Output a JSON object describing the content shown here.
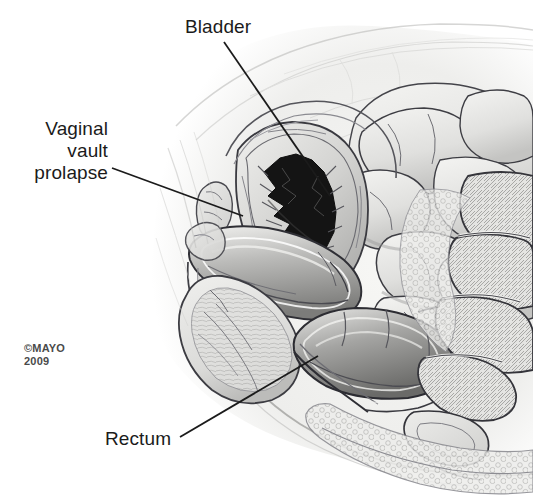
{
  "figure": {
    "background_color": "#ffffff",
    "width": 533,
    "height": 499
  },
  "labels": {
    "bladder": "Bladder",
    "vaginal_vault_prolapse": "Vaginal\nvault\nprolapse",
    "rectum": "Rectum"
  },
  "credit": {
    "text": "©MAYO\n2009"
  },
  "colors": {
    "label_text": "#1b1b1b",
    "credit_text": "#4a4a4a",
    "leader_line": "#1b1b1b",
    "ink_outline": "#2e2e2e",
    "lumen_dark": "#141414",
    "tissue_light": "#e8e8e6",
    "tissue_mid": "#c9c9c7",
    "tissue_shadow": "#9a9a98",
    "bowel_fill": "#e2e2e0"
  },
  "leader_lines": [
    {
      "name": "bladder-leader",
      "x1": 224,
      "y1": 42,
      "x2": 330,
      "y2": 196
    },
    {
      "name": "vaginal-vault-leader",
      "x1": 112,
      "y1": 168,
      "x2": 243,
      "y2": 216
    },
    {
      "name": "rectum-leader",
      "x1": 180,
      "y1": 437,
      "x2": 318,
      "y2": 356
    }
  ],
  "anatomy_parts": [
    "abdominal-wall",
    "small-bowel-loops",
    "bladder",
    "bladder-lumen",
    "prolapsed-vaginal-vault",
    "rectum",
    "anal-canal",
    "sacrum",
    "coccyx",
    "perineal-body",
    "pubic-symphysis"
  ]
}
